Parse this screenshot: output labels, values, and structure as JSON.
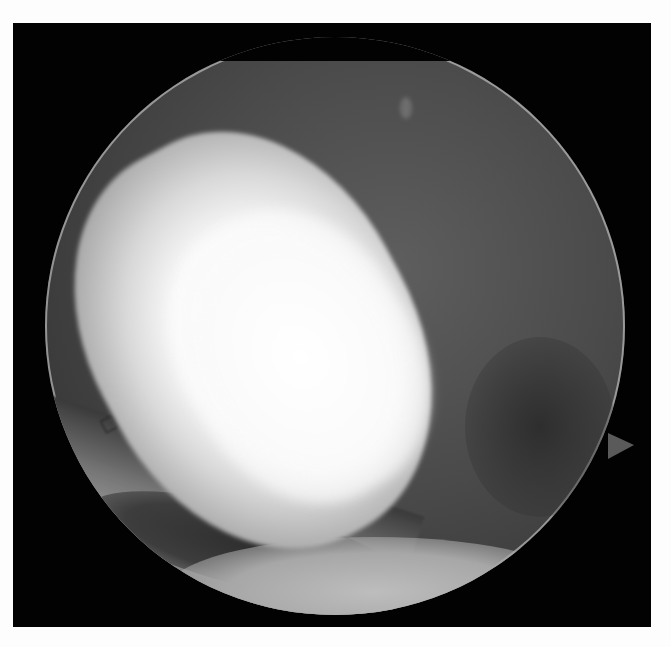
{
  "image": {
    "kind": "endoscopic-view",
    "description": "Circular arthroscopic/endoscopic grayscale view inside a black square frame on white background",
    "regions": [
      {
        "name": "bright-tissue",
        "description": "Large bright oblong tissue structure occupying center-left"
      },
      {
        "name": "instrument",
        "description": "Metallic instrument with engraved markings in lower-left"
      },
      {
        "name": "dark-background-tissue",
        "description": "Mid-gray tissue filling upper-right of field"
      },
      {
        "name": "scope-notch",
        "description": "Small triangular orientation notch on right edge of circular field"
      }
    ],
    "engraved_marks": [
      "◇",
      "C",
      "C"
    ]
  },
  "colors": {
    "page_background": "#fdfdfd",
    "frame": "#020202",
    "highlight": "#ffffff",
    "tissue_gray": "#4a4a4a"
  }
}
